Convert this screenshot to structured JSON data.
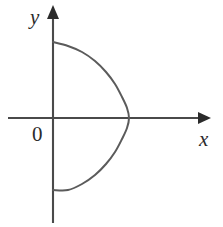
{
  "figure": {
    "background_color": "#ffffff",
    "axis_color": "#4a4a4a",
    "arrow_color": "#2b2b2b",
    "curve_color": "#5b5b5b",
    "label_color": "#2b2b2b"
  },
  "labels": {
    "x_axis": "x",
    "y_axis": "y",
    "origin": "0"
  },
  "chart_data": {
    "type": "line",
    "title": "",
    "xlabel": "x",
    "ylabel": "y",
    "grid": false,
    "legend": null,
    "origin_label": "0",
    "axes": {
      "x_axis_pixel_y": 118,
      "y_axis_pixel_x": 53,
      "x_axis_start_px": 8,
      "x_axis_end_px": 211,
      "y_axis_start_px": 5,
      "y_axis_end_px": 223,
      "x_arrow_direction": "right",
      "y_arrow_direction": "up"
    },
    "curve": {
      "name": "leftward-opening parabola",
      "description": "Symmetric arc about the x-axis opening to the left, endpoints on the y-axis, vertex on the positive x-axis",
      "endpoints_px": [
        [
          53,
          42
        ],
        [
          53,
          190
        ]
      ],
      "vertex_px": [
        129,
        118
      ],
      "points_px": [
        [
          53,
          42
        ],
        [
          68,
          46
        ],
        [
          82,
          52
        ],
        [
          95,
          61
        ],
        [
          106,
          72
        ],
        [
          115,
          84
        ],
        [
          122,
          97
        ],
        [
          127,
          108
        ],
        [
          129,
          118
        ],
        [
          127,
          128
        ],
        [
          122,
          139
        ],
        [
          115,
          152
        ],
        [
          106,
          164
        ],
        [
          95,
          175
        ],
        [
          82,
          184
        ],
        [
          68,
          190
        ],
        [
          53,
          190
        ]
      ]
    }
  }
}
